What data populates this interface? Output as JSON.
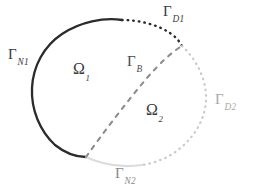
{
  "figure": {
    "type": "geometry-diagram",
    "background_color": "#ffffff",
    "width": 253,
    "height": 194
  },
  "colors": {
    "dark": "#2b2b2b",
    "mid_gray": "#8d8d8d",
    "light_gray": "#cfcfcf",
    "very_light_gray": "#dcdcdc",
    "label_dark": "#3a3a3a",
    "label_light": "#b4b4b4"
  },
  "labels": {
    "gamma_n1": {
      "base": "Γ",
      "sub": "N1"
    },
    "gamma_d1": {
      "base": "Γ",
      "sub": "D1"
    },
    "gamma_d2": {
      "base": "Γ",
      "sub": "D2"
    },
    "gamma_n2": {
      "base": "Γ",
      "sub": "N2"
    },
    "gamma_b": {
      "base": "Γ",
      "sub": "B"
    },
    "omega_1": {
      "base": "Ω",
      "sub": "1"
    },
    "omega_2": {
      "base": "Ω",
      "sub": "2"
    }
  },
  "geometry": {
    "ellipse_center": [
      119,
      92
    ],
    "ellipse_rx": 88,
    "ellipse_ry": 74,
    "ellipse_rotation_deg": -8,
    "interface_start": [
      86,
      157
    ],
    "interface_end": [
      182,
      46
    ],
    "arcs": [
      {
        "name": "gamma-n1-arc",
        "style": "solid",
        "color": "#2b2b2b",
        "width": 2.2
      },
      {
        "name": "gamma-d1-arc",
        "style": "dotted",
        "color": "#2b2b2b",
        "width": 2.2
      },
      {
        "name": "gamma-d2-arc",
        "style": "dotted",
        "color": "#cfcfcf",
        "width": 2.0
      },
      {
        "name": "gamma-n2-arc",
        "style": "solid",
        "color": "#dcdcdc",
        "width": 2.0
      },
      {
        "name": "gamma-b-line",
        "style": "dashed",
        "color": "#8d8d8d",
        "width": 2.0
      }
    ]
  }
}
